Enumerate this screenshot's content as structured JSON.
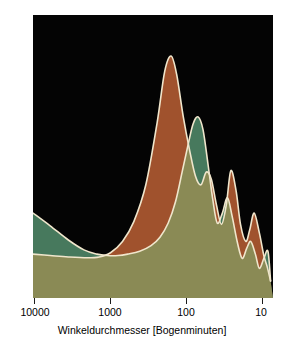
{
  "chart_data": {
    "type": "area",
    "title": "",
    "xlabel": "Winkeldurchmesser [Bogenminuten]",
    "ylabel": "Abweichung von der Durchschnittstemperatur",
    "xscale": "log-reversed",
    "xlim": [
      10000,
      8
    ],
    "xticks": [
      10000,
      1000,
      100,
      10
    ],
    "xtick_labels": [
      "10000",
      "1000",
      "100",
      "10"
    ],
    "yticks": [],
    "ytick_labels": [],
    "ylim": [
      0,
      1
    ],
    "grid": false,
    "legend": false,
    "background": "#040404",
    "outline_color": "#f0e6cc",
    "series": [
      {
        "name": "brown-curve",
        "color": "#a0522d",
        "x": [
          10000,
          6000,
          3500,
          2000,
          1400,
          1000,
          700,
          500,
          350,
          250,
          200,
          165,
          140,
          115,
          95,
          80,
          68,
          58,
          50,
          43,
          37,
          32,
          28,
          24,
          21,
          18,
          16,
          14,
          12,
          10.5,
          9.5,
          8.6
        ],
        "values": [
          0.155,
          0.15,
          0.145,
          0.142,
          0.145,
          0.16,
          0.2,
          0.27,
          0.4,
          0.62,
          0.8,
          0.855,
          0.79,
          0.64,
          0.52,
          0.43,
          0.4,
          0.445,
          0.42,
          0.33,
          0.26,
          0.33,
          0.45,
          0.38,
          0.26,
          0.2,
          0.24,
          0.3,
          0.23,
          0.15,
          0.11,
          0.06
        ]
      },
      {
        "name": "green-curve",
        "color": "#47795d",
        "x": [
          10000,
          6000,
          3500,
          2200,
          1500,
          1100,
          800,
          600,
          420,
          300,
          230,
          180,
          145,
          118,
          100,
          86,
          74,
          64,
          55,
          48,
          42,
          36,
          31,
          27,
          23,
          20,
          17.5,
          15.5,
          13.5,
          12,
          10.5,
          9.3,
          8.6
        ],
        "values": [
          0.3,
          0.255,
          0.205,
          0.17,
          0.155,
          0.15,
          0.15,
          0.155,
          0.165,
          0.185,
          0.215,
          0.265,
          0.34,
          0.45,
          0.54,
          0.615,
          0.64,
          0.595,
          0.47,
          0.35,
          0.265,
          0.3,
          0.355,
          0.29,
          0.195,
          0.14,
          0.175,
          0.2,
          0.155,
          0.105,
          0.14,
          0.165,
          0.06
        ]
      }
    ],
    "overlap_color": "#8a8a55"
  },
  "axis": {
    "xlabel": "Winkeldurchmesser [Bogenminuten]",
    "ylabel": "Abweichung von der Durchschnittstemperatur",
    "xtick_labels": [
      "10000",
      "1000",
      "100",
      "10"
    ]
  }
}
